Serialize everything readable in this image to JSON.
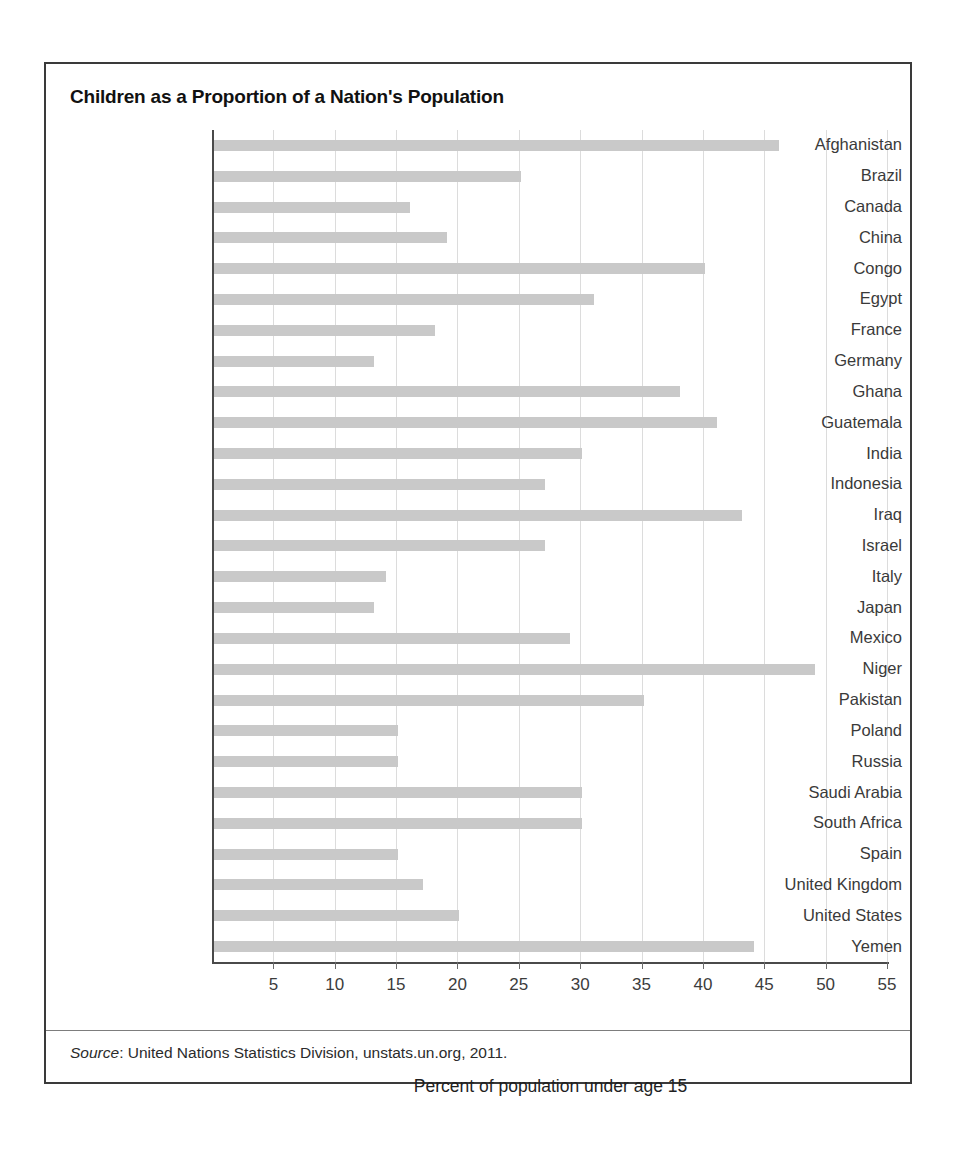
{
  "figure": {
    "title": "Children as a Proportion of a Nation's Population",
    "source_label": "Source",
    "source_rest": ": United Nations Statistics Division, unstats.un.org, 2011.",
    "scan_artifact": ""
  },
  "colors": {
    "bar": "#c9c9c9",
    "gridline": "#dcdcdc",
    "axis": "#4a4a4a",
    "frame": "#3a3a3a",
    "title_text": "#111111",
    "label_text": "#3a3a3a"
  },
  "chart_data": {
    "type": "bar",
    "orientation": "horizontal",
    "title": "Children as a Proportion of a Nation's Population",
    "xlabel": "Percent of population under age 15",
    "ylabel": "",
    "xlim": [
      0,
      55
    ],
    "xticks": [
      5,
      10,
      15,
      20,
      25,
      30,
      35,
      40,
      45,
      50,
      55
    ],
    "grid": "vertical",
    "legend": "none",
    "categories": [
      "Afghanistan",
      "Brazil",
      "Canada",
      "China",
      "Congo",
      "Egypt",
      "France",
      "Germany",
      "Ghana",
      "Guatemala",
      "India",
      "Indonesia",
      "Iraq",
      "Israel",
      "Italy",
      "Japan",
      "Mexico",
      "Niger",
      "Pakistan",
      "Poland",
      "Russia",
      "Saudi Arabia",
      "South Africa",
      "Spain",
      "United Kingdom",
      "United States",
      "Yemen"
    ],
    "values": [
      46,
      25,
      16,
      19,
      40,
      31,
      18,
      13,
      38,
      41,
      30,
      27,
      43,
      27,
      14,
      13,
      29,
      49,
      35,
      15,
      15,
      30,
      30,
      15,
      17,
      20,
      44
    ]
  }
}
